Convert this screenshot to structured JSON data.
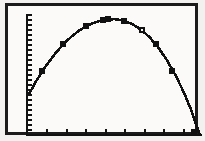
{
  "screen": {
    "title": "Graphing calculator plot screen",
    "device": "graphing-calculator",
    "background_color": "#fbfaf8",
    "ink_color": "#111111",
    "frame_color": "#1b1b1b"
  },
  "chart_data": {
    "type": "scatter",
    "title": "",
    "subtitle": "",
    "xlabel": "",
    "ylabel": "",
    "xlim": [
      0,
      10
    ],
    "ylim": [
      0,
      7
    ],
    "grid": false,
    "legend": null,
    "axis_style": "tick-marked axes, no numeric labels",
    "x_tick_count": 8,
    "y_tick_count": 24,
    "series": [
      {
        "name": "Fitted quadratic curve",
        "type": "line",
        "points": [
          {
            "x": 0.1,
            "y": 2.3
          },
          {
            "x": 0.5,
            "y": 3.05
          },
          {
            "x": 1.0,
            "y": 3.85
          },
          {
            "x": 1.5,
            "y": 4.55
          },
          {
            "x": 2.0,
            "y": 5.15
          },
          {
            "x": 2.5,
            "y": 5.65
          },
          {
            "x": 3.0,
            "y": 6.05
          },
          {
            "x": 3.5,
            "y": 6.35
          },
          {
            "x": 4.0,
            "y": 6.55
          },
          {
            "x": 4.5,
            "y": 6.68
          },
          {
            "x": 5.0,
            "y": 6.7
          },
          {
            "x": 5.5,
            "y": 6.62
          },
          {
            "x": 6.0,
            "y": 6.42
          },
          {
            "x": 6.5,
            "y": 6.1
          },
          {
            "x": 7.0,
            "y": 5.65
          },
          {
            "x": 7.5,
            "y": 5.05
          },
          {
            "x": 8.0,
            "y": 4.3
          },
          {
            "x": 8.5,
            "y": 3.4
          },
          {
            "x": 9.0,
            "y": 2.35
          },
          {
            "x": 9.4,
            "y": 1.35
          },
          {
            "x": 9.7,
            "y": 0.45
          },
          {
            "x": 9.85,
            "y": 0.0
          }
        ]
      },
      {
        "name": "Data points",
        "type": "scatter",
        "marker": "filled-square",
        "points": [
          {
            "x": 0.85,
            "y": 3.65
          },
          {
            "x": 2.05,
            "y": 5.25
          },
          {
            "x": 3.35,
            "y": 6.3
          },
          {
            "x": 4.35,
            "y": 6.65
          },
          {
            "x": 4.6,
            "y": 6.68
          },
          {
            "x": 5.55,
            "y": 6.6
          },
          {
            "x": 7.35,
            "y": 5.25
          },
          {
            "x": 8.3,
            "y": 3.7
          },
          {
            "x": 9.55,
            "y": 0.1
          }
        ]
      },
      {
        "name": "Cursor point",
        "type": "scatter",
        "marker": "open-square",
        "points": [
          {
            "x": 6.55,
            "y": 6.05
          }
        ]
      }
    ]
  }
}
